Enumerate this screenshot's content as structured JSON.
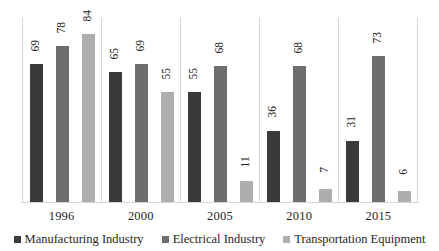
{
  "chart_data": {
    "type": "bar",
    "title": "",
    "subtitle": "",
    "xlabel": "",
    "ylabel": "",
    "categories": [
      "1996",
      "2000",
      "2005",
      "2010",
      "2015"
    ],
    "series": [
      {
        "name": "Manufacturing Industry",
        "color": "#3a3a3a",
        "values": [
          69,
          65,
          55,
          36,
          31
        ]
      },
      {
        "name": "Electrical Industry",
        "color": "#6e6e6e",
        "values": [
          78,
          69,
          68,
          68,
          73
        ]
      },
      {
        "name": "Transportation Equipment",
        "color": "#aeaeae",
        "values": [
          84,
          55,
          11,
          7,
          6
        ]
      }
    ],
    "ylim": [
      0,
      92
    ],
    "grid": false,
    "y_axis_visible": false,
    "data_labels": true,
    "data_label_rotation": -90,
    "legend_position": "bottom",
    "group_separators": true
  },
  "legend": {
    "items": [
      {
        "label": "Manufacturing Industry",
        "swatch": "legend-swatch-dark"
      },
      {
        "label": "Electrical Industry",
        "swatch": "legend-swatch-medium"
      },
      {
        "label": "Transportation Equipment",
        "swatch": "legend-swatch-light"
      }
    ]
  },
  "colors": {
    "series_1": "#3a3a3a",
    "series_2": "#6e6e6e",
    "series_3": "#aeaeae",
    "axis": "#d5d5d5",
    "text": "#262626",
    "background": "#ffffff"
  }
}
